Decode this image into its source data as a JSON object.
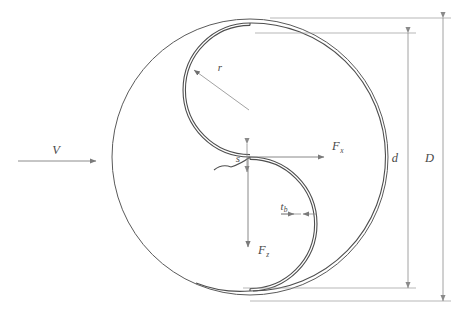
{
  "figure": {
    "background_color": "#ffffff",
    "line_color": "#5a5a5a",
    "dim_color": "#8a8a8a",
    "label_color": "#4a4a4a"
  },
  "labels": {
    "velocity": "V",
    "radius": "r",
    "overlap": "s",
    "thickness_base": "t",
    "thickness_sub": "b",
    "force_x_base": "F",
    "force_x_sub": "x",
    "force_z_base": "F",
    "force_z_sub": "z",
    "rotor_diameter": "d",
    "endplate_diameter": "D"
  },
  "annotations": {
    "velocity_desc": "free-stream wind velocity arrow pointing right",
    "radius_desc": "blade radius leader arrow to upper blade arc",
    "overlap_desc": "overlap gap vertical double arrow",
    "thickness_desc": "blade thickness horizontal double arrow",
    "force_x_desc": "horizontal force component arrow pointing right",
    "force_z_desc": "vertical force component arrow pointing down",
    "rotor_diameter_desc": "rotor diameter vertical dimension",
    "endplate_diameter_desc": "end plate diameter vertical dimension"
  },
  "geometry": {
    "outer_circle": {
      "cx": 250,
      "cy": 157,
      "r": 138
    },
    "upper_blade": {
      "cx": 250,
      "cy": 90,
      "r": 68
    },
    "lower_blade": {
      "cx": 250,
      "cy": 222,
      "r": 68
    },
    "dim_d": {
      "x": 408,
      "y_top": 33,
      "y_bottom": 288
    },
    "dim_D": {
      "x": 443,
      "y_top": 18,
      "y_bottom": 301
    }
  }
}
